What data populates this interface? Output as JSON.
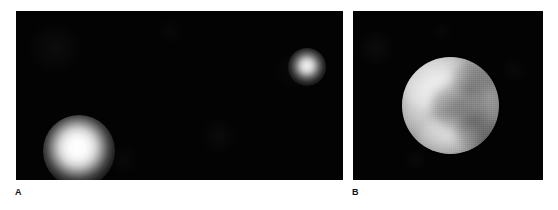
{
  "figure": {
    "background_color": "#ffffff",
    "width": 558,
    "height": 210,
    "panels": [
      {
        "id": "a",
        "caption_label": "A",
        "background_color": "#030303",
        "description": "Unresolved point-like images of two bright objects on a black sky field",
        "objects": [
          {
            "name": "large-blob",
            "label": "Pluto",
            "center_x": 63,
            "center_y": 140,
            "radius": 18,
            "peak_color": "#ffffff",
            "relative_brightness": 1.0
          },
          {
            "name": "small-blob",
            "label": "Charon",
            "center_x": 291,
            "center_y": 56,
            "radius": 9,
            "peak_color": "#ededed",
            "relative_brightness": 0.55
          }
        ]
      },
      {
        "id": "b",
        "caption_label": "B",
        "background_color": "#030303",
        "description": "Resolved grayscale disk showing bright polar regions and a dark equatorial band",
        "objects": [
          {
            "name": "resolved-disk",
            "center_x": 450,
            "center_y": 95,
            "radius": 48,
            "bright_color": "#ffffff",
            "mid_color": "#b4b4b4",
            "dark_color": "#4e4e4e",
            "features": [
              "bright-northwest-limb",
              "bright-south-polar-cap",
              "bright-west-limb",
              "dark-central-band",
              "dark-northeast-patch",
              "dark-southeast-patch"
            ]
          }
        ]
      }
    ]
  },
  "captions": {
    "panel_a": "A",
    "panel_b": "B"
  },
  "colors": {
    "page_background": "#ffffff",
    "sky_black": "#030303",
    "caption_text": "#111111"
  }
}
